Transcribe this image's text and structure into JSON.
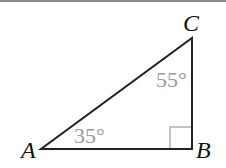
{
  "diagram": {
    "type": "right-triangle",
    "vertices": [
      {
        "label": "A",
        "x": 41,
        "y": 149
      },
      {
        "label": "B",
        "x": 192,
        "y": 149
      },
      {
        "label": "C",
        "x": 192,
        "y": 38
      }
    ],
    "angles": [
      {
        "vertex": "A",
        "label": "35°"
      },
      {
        "vertex": "C",
        "label": "55°"
      },
      {
        "vertex": "B",
        "right_angle": true
      }
    ],
    "colors": {
      "stroke": "#222222",
      "angle_text": "#9a9a9a",
      "right_angle_marker": "#888888",
      "vertex_text": "#111111"
    }
  }
}
